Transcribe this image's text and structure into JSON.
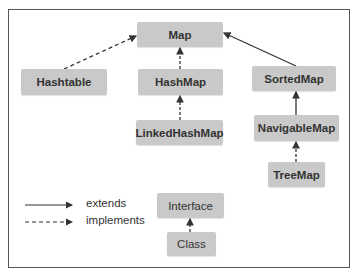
{
  "diagram": {
    "nodes": {
      "map": "Map",
      "hashtable": "Hashtable",
      "hashmap": "HashMap",
      "sortedmap": "SortedMap",
      "linkedhashmap": "LinkedHashMap",
      "navigablemap": "NavigableMap",
      "treemap": "TreeMap"
    },
    "edges": [
      {
        "from": "Hashtable",
        "to": "Map",
        "type": "implements"
      },
      {
        "from": "HashMap",
        "to": "Map",
        "type": "implements"
      },
      {
        "from": "SortedMap",
        "to": "Map",
        "type": "extends"
      },
      {
        "from": "LinkedHashMap",
        "to": "HashMap",
        "type": "implements"
      },
      {
        "from": "NavigableMap",
        "to": "SortedMap",
        "type": "extends"
      },
      {
        "from": "TreeMap",
        "to": "NavigableMap",
        "type": "implements"
      },
      {
        "from": "Class",
        "to": "Interface",
        "type": "implements"
      }
    ]
  },
  "legend": {
    "extends": "extends",
    "implements": "implements",
    "interface": "Interface",
    "class": "Class"
  },
  "colors": {
    "box_fill": "#c9c9c9",
    "line": "#333333",
    "frame": "#555555"
  }
}
